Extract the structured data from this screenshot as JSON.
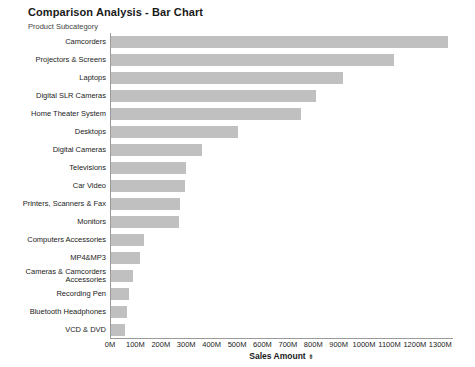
{
  "chart_data": {
    "type": "bar",
    "orientation": "horizontal",
    "title": "Comparison Analysis - Bar Chart",
    "ylabel": "Product Subcategory",
    "xlabel": "Sales Amount",
    "xlabel_sort_glyph": "⇟",
    "grid": false,
    "legend": null,
    "xlim": [
      0,
      1350000000
    ],
    "x_tick_labels": [
      "0M",
      "100M",
      "200M",
      "300M",
      "400M",
      "500M",
      "600M",
      "700M",
      "800M",
      "900M",
      "1000M",
      "1100M",
      "1200M",
      "1300M"
    ],
    "x_tick_values": [
      0,
      100,
      200,
      300,
      400,
      500,
      600,
      700,
      800,
      900,
      1000,
      1100,
      1200,
      1300
    ],
    "bar_color": "#c0c0c0",
    "categories": [
      "Camcorders",
      "Projectors & Screens",
      "Laptops",
      "Digital SLR Cameras",
      "Home Theater System",
      "Desktops",
      "Digital Cameras",
      "Televisions",
      "Car Video",
      "Printers, Scanners & Fax",
      "Monitors",
      "Computers Accessories",
      "MP4&MP3",
      "Cameras & Camcorders Accessories",
      "Recording Pen",
      "Bluetooth Headphones",
      "VCD & DVD"
    ],
    "values": [
      1325,
      1113,
      912,
      806,
      748,
      500,
      358,
      295,
      292,
      272,
      268,
      130,
      113,
      88,
      72,
      62,
      55
    ]
  }
}
